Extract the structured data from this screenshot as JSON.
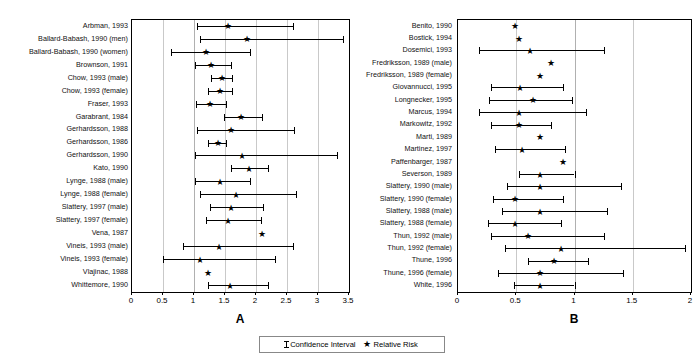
{
  "legend": {
    "ci_label": "Confidence Interval",
    "rr_label": "Relative Risk",
    "ci_icon": "error-bar-icon",
    "rr_icon": "star-icon"
  },
  "chart_data": [
    {
      "type": "forest",
      "panel": "A",
      "title": "",
      "xlabel": "",
      "ylabel": "",
      "xlim": [
        0,
        3.5
      ],
      "xticks": [
        0,
        0.5,
        1,
        1.5,
        2,
        2.5,
        3,
        3.5
      ],
      "xticklabels": [
        "0",
        "0.5",
        "1",
        "1.5",
        "2",
        "2.5",
        "3",
        "3.5"
      ],
      "grid": true,
      "reference_line": 1,
      "marker": "star",
      "series_name": "Relative Risk",
      "rows": [
        {
          "label": "Arbman, 1993",
          "rr": 1.55,
          "low": 1.05,
          "high": 2.6
        },
        {
          "label": "Ballard-Babash, 1990 (men)",
          "rr": 1.85,
          "low": 1.1,
          "high": 3.4
        },
        {
          "label": "Ballard-Babash, 1990 (women)",
          "rr": 1.2,
          "low": 0.63,
          "high": 1.9
        },
        {
          "label": "Brownson, 1991",
          "rr": 1.28,
          "low": 1.02,
          "high": 1.6
        },
        {
          "label": "Chow, 1993 (male)",
          "rr": 1.45,
          "low": 1.27,
          "high": 1.62
        },
        {
          "label": "Chow, 1993 (female)",
          "rr": 1.42,
          "low": 1.22,
          "high": 1.62
        },
        {
          "label": "Fraser, 1993",
          "rr": 1.25,
          "low": 1.03,
          "high": 1.52
        },
        {
          "label": "Garabrant, 1984",
          "rr": 1.75,
          "low": 1.48,
          "high": 2.1
        },
        {
          "label": "Gerhardsson, 1988",
          "rr": 1.6,
          "low": 1.05,
          "high": 2.62
        },
        {
          "label": "Gerhardsson, 1986",
          "rr": 1.38,
          "low": 1.22,
          "high": 1.52
        },
        {
          "label": "Gerhardsson, 1990",
          "rr": 1.78,
          "low": 1.02,
          "high": 3.3
        },
        {
          "label": "Kato, 1990",
          "rr": 1.88,
          "low": 1.6,
          "high": 2.2
        },
        {
          "label": "Lynge, 1988 (male)",
          "rr": 1.42,
          "low": 1.02,
          "high": 1.9
        },
        {
          "label": "Lynge, 1988 (female)",
          "rr": 1.68,
          "low": 1.1,
          "high": 2.65
        },
        {
          "label": "Slattery, 1997 (male)",
          "rr": 1.6,
          "low": 1.25,
          "high": 2.12
        },
        {
          "label": "Slattery, 1997 (female)",
          "rr": 1.55,
          "low": 1.2,
          "high": 2.08
        },
        {
          "label": "Vena, 1987",
          "rr": 2.1,
          "low": null,
          "high": null
        },
        {
          "label": "Vineis, 1993 (male)",
          "rr": 1.4,
          "low": 0.82,
          "high": 2.6
        },
        {
          "label": "Vineis, 1993 (female)",
          "rr": 1.1,
          "low": 0.5,
          "high": 2.3
        },
        {
          "label": "Vlajinac, 1988",
          "rr": 1.22,
          "low": null,
          "high": null
        },
        {
          "label": "Whittemore, 1990",
          "rr": 1.58,
          "low": 1.22,
          "high": 2.2
        }
      ]
    },
    {
      "type": "forest",
      "panel": "B",
      "title": "",
      "xlabel": "",
      "ylabel": "",
      "xlim": [
        0,
        2
      ],
      "xticks": [
        0,
        0.5,
        1,
        1.5,
        2
      ],
      "xticklabels": [
        "0",
        "0.5",
        "1",
        "1.5",
        "2"
      ],
      "grid": true,
      "reference_line": 1,
      "marker": "star",
      "series_name": "Relative Risk",
      "rows": [
        {
          "label": "Benito, 1990",
          "rr": 0.49,
          "low": null,
          "high": null
        },
        {
          "label": "Bostick, 1994",
          "rr": 0.52,
          "low": null,
          "high": null
        },
        {
          "label": "Dosemici, 1993",
          "rr": 0.62,
          "low": 0.18,
          "high": 1.25
        },
        {
          "label": "Fredriksson, 1989 (male)",
          "rr": 0.8,
          "low": null,
          "high": null
        },
        {
          "label": "Fredriksson, 1989 (female)",
          "rr": 0.7,
          "low": null,
          "high": null
        },
        {
          "label": "Giovannucci, 1995",
          "rr": 0.53,
          "low": 0.28,
          "high": 0.9
        },
        {
          "label": "Longnecker, 1995",
          "rr": 0.64,
          "low": 0.27,
          "high": 0.98
        },
        {
          "label": "Marcus, 1994",
          "rr": 0.52,
          "low": 0.18,
          "high": 1.1
        },
        {
          "label": "Markowitz, 1992",
          "rr": 0.52,
          "low": 0.28,
          "high": 0.8
        },
        {
          "label": "Marti, 1989",
          "rr": 0.7,
          "low": null,
          "high": null
        },
        {
          "label": "Martinez, 1997",
          "rr": 0.55,
          "low": 0.32,
          "high": 0.92
        },
        {
          "label": "Paffenbarger, 1987",
          "rr": 0.9,
          "low": null,
          "high": null
        },
        {
          "label": "Severson, 1989",
          "rr": 0.7,
          "low": 0.52,
          "high": 1.0
        },
        {
          "label": "Slattery, 1990 (male)",
          "rr": 0.7,
          "low": 0.42,
          "high": 1.4
        },
        {
          "label": "Slattery, 1990 (female)",
          "rr": 0.49,
          "low": 0.3,
          "high": 0.9
        },
        {
          "label": "Slattery, 1988 (male)",
          "rr": 0.7,
          "low": 0.38,
          "high": 1.28
        },
        {
          "label": "Slattery, 1988 (female)",
          "rr": 0.49,
          "low": 0.26,
          "high": 0.88
        },
        {
          "label": "Thun, 1992 (male)",
          "rr": 0.6,
          "low": 0.28,
          "high": 1.25
        },
        {
          "label": "Thun, 1992 (female)",
          "rr": 0.88,
          "low": 0.4,
          "high": 1.95
        },
        {
          "label": "Thune, 1996",
          "rr": 0.82,
          "low": 0.6,
          "high": 1.12
        },
        {
          "label": "Thune, 1996 (female)",
          "rr": 0.7,
          "low": 0.34,
          "high": 1.42
        },
        {
          "label": "White, 1996",
          "rr": 0.7,
          "low": 0.48,
          "high": 1.0
        }
      ]
    }
  ],
  "panels": {
    "a_letter": "A",
    "b_letter": "B"
  }
}
